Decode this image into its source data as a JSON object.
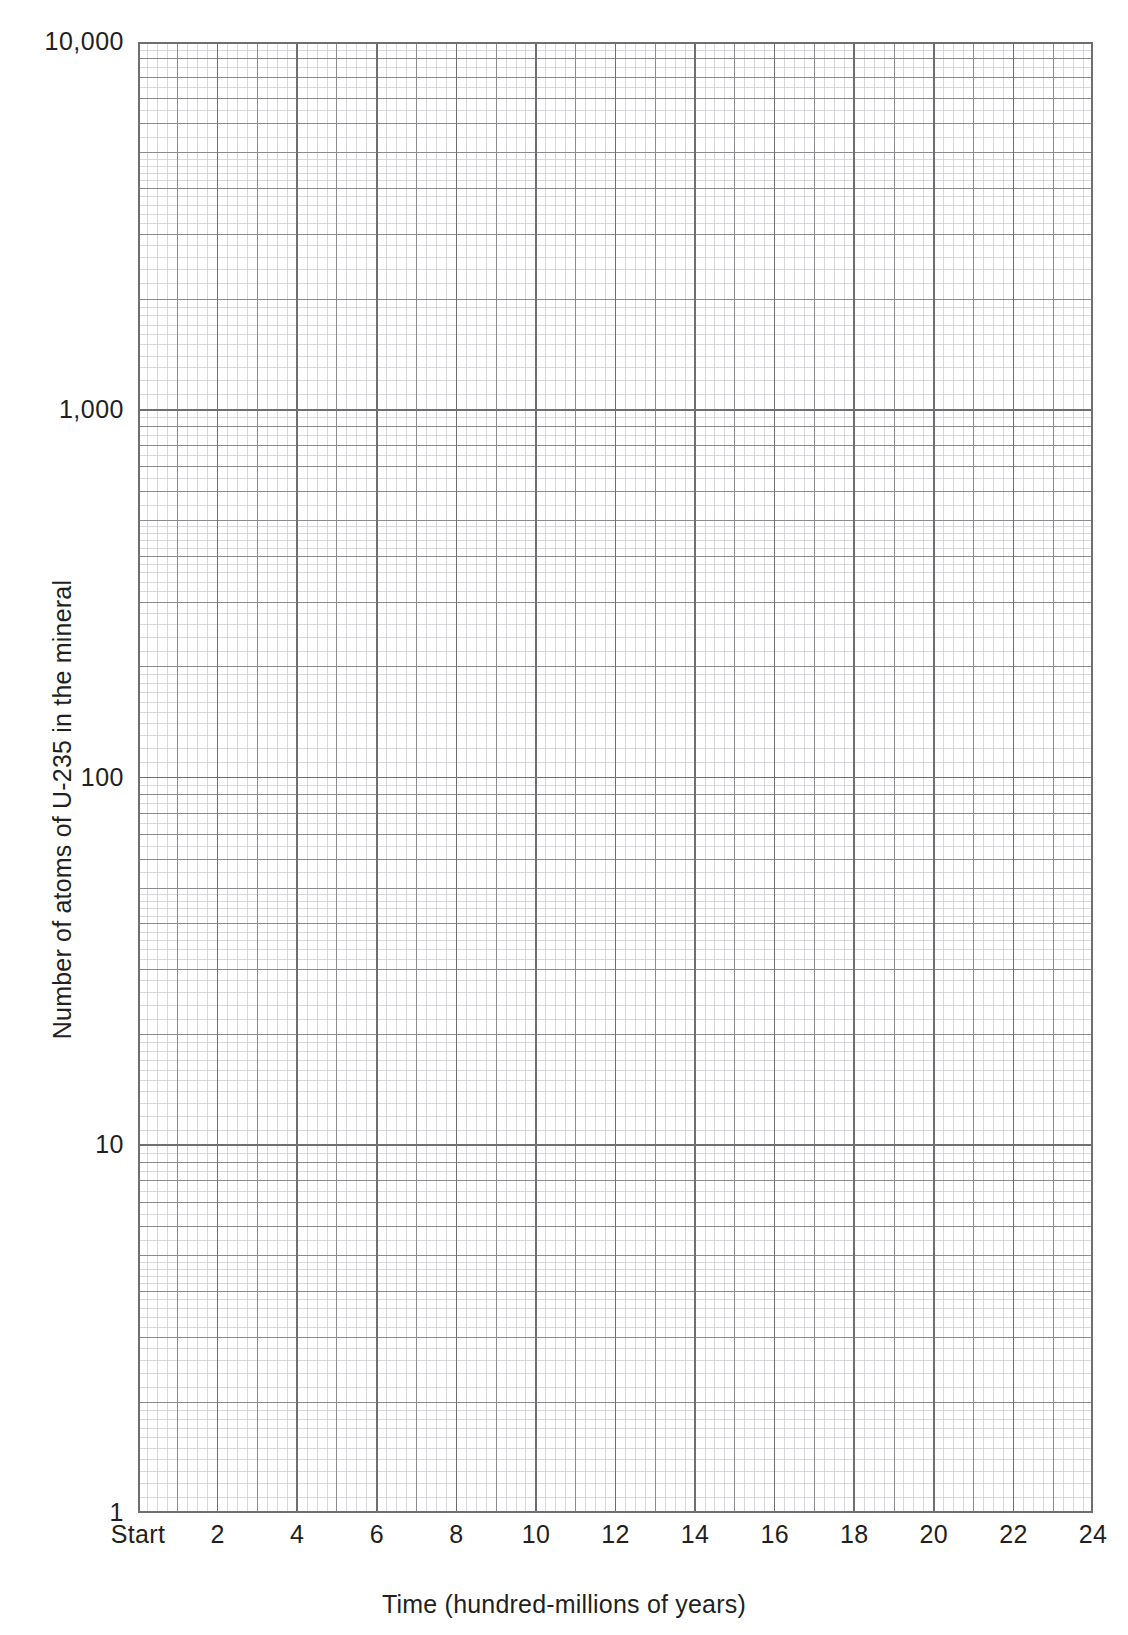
{
  "figure": {
    "caption_fragment": "",
    "background_color": "#ffffff",
    "ink_color": "#231f20",
    "grid_major_color": "#8c8c90",
    "grid_minor_color": "#c9c9cd",
    "grid_decade_color": "#6e6e73",
    "axis_color": "#6e6e73"
  },
  "chart_data": {
    "type": "line",
    "title": "",
    "subtitle": "",
    "xlabel": "Time (hundred-millions of years)",
    "ylabel": "Number of atoms of U-235 in the mineral",
    "xscale": "linear",
    "yscale": "log",
    "xlim": [
      0,
      24
    ],
    "ylim": [
      1,
      10000
    ],
    "grid": true,
    "grid_style": "semi-log graph paper (4 decades vertical, linear horizontal)",
    "legend": null,
    "legend_position": "none",
    "annotations": [],
    "series": [],
    "x_tick_labels": [
      "Start",
      "2",
      "4",
      "6",
      "8",
      "10",
      "12",
      "14",
      "16",
      "18",
      "20",
      "22",
      "24"
    ],
    "x_tick_values": [
      0,
      2,
      4,
      6,
      8,
      10,
      12,
      14,
      16,
      18,
      20,
      22,
      24
    ],
    "x_minor_tick_step": 0.25,
    "y_tick_labels": [
      "10,000",
      "1,000",
      "100",
      "10",
      "1"
    ],
    "y_tick_values": [
      10000,
      1000,
      100,
      10,
      1
    ],
    "y_minor_decade_multipliers": [
      2,
      3,
      4,
      5,
      6,
      7,
      8,
      9
    ],
    "values": [],
    "categories": [],
    "note": "Blank semi-logarithmic graph paper grid; no data plotted."
  },
  "axes": {
    "y_labels": [
      {
        "text": "10,000",
        "value": 10000
      },
      {
        "text": "1,000",
        "value": 1000
      },
      {
        "text": "100",
        "value": 100
      },
      {
        "text": "10",
        "value": 10
      },
      {
        "text": "1",
        "value": 1
      }
    ],
    "x_labels": [
      {
        "text": "Start",
        "value": 0
      },
      {
        "text": "2",
        "value": 2
      },
      {
        "text": "4",
        "value": 4
      },
      {
        "text": "6",
        "value": 6
      },
      {
        "text": "8",
        "value": 8
      },
      {
        "text": "10",
        "value": 10
      },
      {
        "text": "12",
        "value": 12
      },
      {
        "text": "14",
        "value": 14
      },
      {
        "text": "16",
        "value": 16
      },
      {
        "text": "18",
        "value": 18
      },
      {
        "text": "20",
        "value": 20
      },
      {
        "text": "22",
        "value": 22
      },
      {
        "text": "24",
        "value": 24
      }
    ],
    "x_title": "Time (hundred-millions of years)",
    "y_title": "Number of atoms of U-235 in the mineral"
  }
}
